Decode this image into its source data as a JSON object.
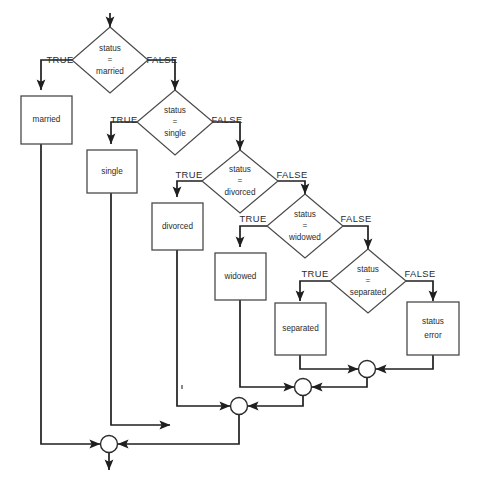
{
  "diagram": {
    "type": "flowchart",
    "colors": {
      "background": "#ffffff",
      "box_stroke": "#4a4a4a",
      "diamond_stroke": "#4a4a4a",
      "connector": "#1f1f1f",
      "text": "#2b2b2b"
    },
    "decisions": [
      {
        "id": "d1",
        "line1": "status",
        "line2": "=",
        "line3": "married",
        "true_label": "TRUE",
        "false_label": "FALSE"
      },
      {
        "id": "d2",
        "line1": "status",
        "line2": "=",
        "line3": "single",
        "true_label": "TRUE",
        "false_label": "FALSE"
      },
      {
        "id": "d3",
        "line1": "status",
        "line2": "=",
        "line3": "divorced",
        "true_label": "TRUE",
        "false_label": "FALSE"
      },
      {
        "id": "d4",
        "line1": "status",
        "line2": "=",
        "line3": "widowed",
        "true_label": "TRUE",
        "false_label": "FALSE"
      },
      {
        "id": "d5",
        "line1": "status",
        "line2": "=",
        "line3": "separated",
        "true_label": "TRUE",
        "false_label": "FALSE"
      }
    ],
    "processes": [
      {
        "id": "p1",
        "label": "married"
      },
      {
        "id": "p2",
        "label": "single"
      },
      {
        "id": "p3",
        "label": "divorced"
      },
      {
        "id": "p4",
        "label": "widowed"
      },
      {
        "id": "p5",
        "label": "separated"
      },
      {
        "id": "p6",
        "line1": "status",
        "line2": "error"
      }
    ],
    "merge_nodes": [
      {
        "id": "m1"
      },
      {
        "id": "m2"
      },
      {
        "id": "m3"
      },
      {
        "id": "m4"
      }
    ]
  }
}
